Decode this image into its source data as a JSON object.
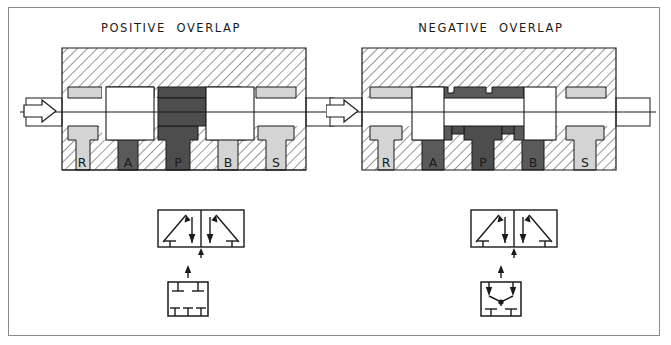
{
  "figure": {
    "background_color": "#ffffff",
    "border_color": "#8a8a8a",
    "panels": [
      {
        "id": "positive-overlap",
        "title": "POSITIVE  OVERLAP",
        "port_labels": [
          "R",
          "A",
          "P",
          "B",
          "S"
        ],
        "inlet_arrow": "hollow-arrow-right",
        "spool_type": "positive-overlap",
        "land_wider_than_port": true,
        "symbol_main": {
          "kind": "4-way-3-position-valve-symbol",
          "boxes": 2,
          "left_box": "crossed-flow-arrows",
          "right_box": "crossed-flow-arrows",
          "actuator": "arrow-up"
        },
        "symbol_sub": {
          "kind": "center-position-detail",
          "center_type": "closed-center",
          "top_ports": 2,
          "bottom_ports": 3,
          "has_junction_dot": false,
          "actuator": "arrow-up"
        }
      },
      {
        "id": "negative-overlap",
        "title": "NEGATIVE  OVERLAP",
        "port_labels": [
          "R",
          "A",
          "P",
          "B",
          "S"
        ],
        "inlet_arrow": "hollow-arrow-right",
        "spool_type": "negative-overlap",
        "land_wider_than_port": false,
        "symbol_main": {
          "kind": "4-way-3-position-valve-symbol",
          "boxes": 2,
          "left_box": "crossed-flow-arrows",
          "right_box": "crossed-flow-arrows",
          "actuator": "arrow-up"
        },
        "symbol_sub": {
          "kind": "center-position-detail",
          "center_type": "open-center",
          "top_ports": 0,
          "bottom_ports": 2,
          "has_junction_dot": true,
          "actuator": "arrow-up"
        }
      }
    ],
    "colors": {
      "hatch_line": "#4a4a4a",
      "hatch_bg": "#ffffff",
      "body_light": "#d4d4d4",
      "spool_dark": "#5a5a5a",
      "spool_darker": "#4d4d4d",
      "white_fill": "#ffffff",
      "outline": "#1a1a1a",
      "label_text": "#1a1a1a"
    }
  }
}
